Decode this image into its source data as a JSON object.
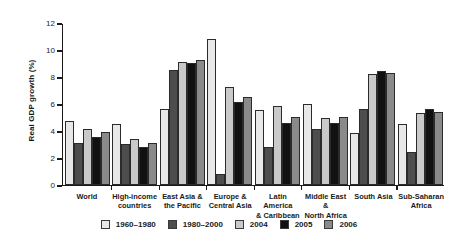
{
  "chart_data": {
    "type": "bar",
    "title": "",
    "xlabel": "",
    "ylabel": "Real GDP growth (%)",
    "ylim": [
      0,
      12
    ],
    "yticks": [
      0,
      2,
      4,
      6,
      8,
      10,
      12
    ],
    "grid": false,
    "legend_position": "bottom",
    "categories": [
      "World",
      "High-income countries",
      "East Asia & the Pacific",
      "Europe & Central Asia",
      "Latin America & Caribbean",
      "Middle East & North Africa",
      "South Asia",
      "Sub-Saharan Africa"
    ],
    "category_lines": [
      [
        "World"
      ],
      [
        "High-income",
        "countries"
      ],
      [
        "East Asia &",
        "the Pacific"
      ],
      [
        "Europe &",
        "Central Asia"
      ],
      [
        "Latin America",
        "& Caribbean"
      ],
      [
        "Middle East &",
        "North Africa"
      ],
      [
        "South Asia"
      ],
      [
        "Sub-Saharan",
        "Africa"
      ]
    ],
    "series": [
      {
        "name": "1960–1980",
        "color": "#e8e8e8",
        "values": [
          4.7,
          4.5,
          5.6,
          10.8,
          5.5,
          6.0,
          3.8,
          4.5
        ]
      },
      {
        "name": "1980–2000",
        "color": "#4d4d4d",
        "values": [
          3.1,
          3.0,
          8.5,
          0.8,
          2.8,
          4.1,
          5.6,
          2.4
        ]
      },
      {
        "name": "2004",
        "color": "#c9c9c9",
        "values": [
          4.1,
          3.4,
          9.1,
          7.2,
          5.8,
          4.9,
          8.2,
          5.3
        ]
      },
      {
        "name": "2005",
        "color": "#111111",
        "values": [
          3.5,
          2.8,
          9.0,
          6.1,
          4.6,
          4.6,
          8.4,
          5.6
        ]
      },
      {
        "name": "2006",
        "color": "#8a8a8a",
        "values": [
          3.9,
          3.1,
          9.2,
          6.5,
          5.0,
          5.0,
          8.3,
          5.4
        ]
      }
    ]
  }
}
